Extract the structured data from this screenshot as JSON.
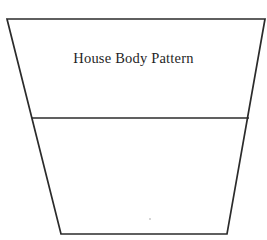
{
  "document": {
    "title": "House Body Pattern",
    "background_color": "#ffffff",
    "width": 267,
    "height": 240
  },
  "figure": {
    "kind": "sewing-pattern-piece",
    "shape": "trapezoid",
    "line_color": "#2b2b2b",
    "fill_color": "#ffffff",
    "stroke_width": 1.7,
    "outline_points": "7,19 265,19 227,234 61,234",
    "divider": {
      "name": "horizontal-fold-line",
      "x1": 32,
      "y1": 118,
      "x2": 249,
      "y2": 118
    },
    "speck": {
      "cx": 150,
      "cy": 219,
      "r": 1
    }
  },
  "label": {
    "text": "House Body Pattern",
    "color": "#1f1f1f",
    "font_size_px": 14.5,
    "top_px": 51
  }
}
